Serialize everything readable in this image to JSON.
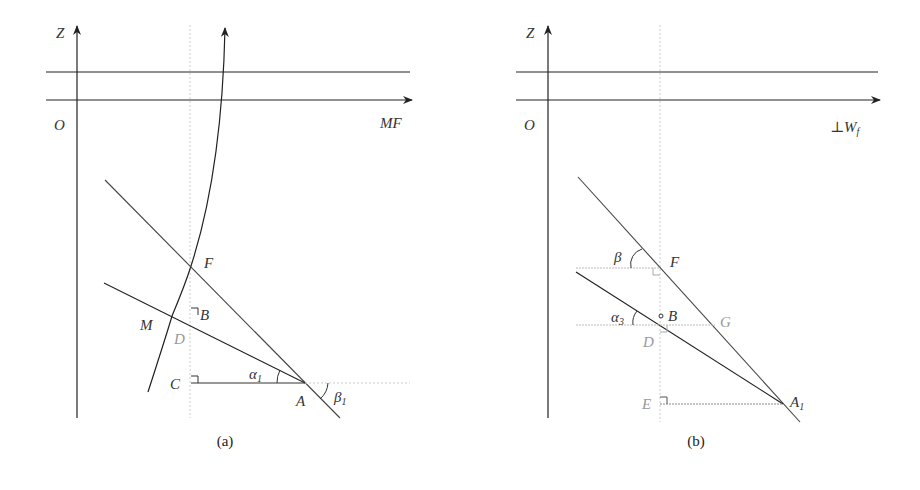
{
  "figure": {
    "panel_a": {
      "caption": "(a)",
      "axis_z": "Z",
      "origin": "O",
      "axis_x": "MF",
      "points": {
        "F": "F",
        "B": "B",
        "M": "M",
        "D": "D",
        "C": "C",
        "A": "A"
      },
      "angles": {
        "alpha": "α",
        "alpha_sub": "1",
        "beta": "β",
        "beta_sub": "1"
      }
    },
    "panel_b": {
      "caption": "(b)",
      "axis_z": "Z",
      "origin": "O",
      "axis_x": "⊥W",
      "axis_x_sub": "f",
      "points": {
        "F": "F",
        "B": "B",
        "G": "G",
        "D": "D",
        "E": "E",
        "A": "A",
        "A_sub": "1"
      },
      "angles": {
        "beta": "β",
        "alpha": "α",
        "alpha_sub": "3"
      }
    }
  }
}
